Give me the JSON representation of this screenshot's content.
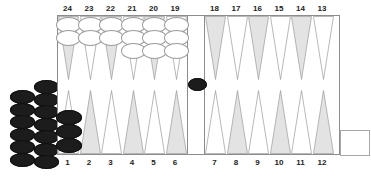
{
  "board": {
    "title": "Backgammon board position",
    "bar_label": "bar",
    "point_numbers_top": [
      "24",
      "23",
      "22",
      "21",
      "20",
      "19",
      "18",
      "17",
      "16",
      "15",
      "14",
      "13"
    ],
    "point_numbers_bottom": [
      "1",
      "2",
      "3",
      "4",
      "5",
      "6",
      "7",
      "8",
      "9",
      "10",
      "11",
      "12"
    ],
    "colors": {
      "point_light": "#ffffff",
      "point_shaded": "#e3e3e3",
      "point_outline": "#9a9a9a",
      "frame": "#8c8c8c",
      "black_checker": "#1c1c1c",
      "white_checker": "#ffffff",
      "white_checker_outline": "#9a9a9a",
      "label_text": "#222222",
      "background": "#ffffff"
    },
    "points": [
      {
        "number": "24",
        "quadrant": "top-left",
        "index": 0,
        "checkers": 2,
        "color": "white"
      },
      {
        "number": "23",
        "quadrant": "top-left",
        "index": 1,
        "checkers": 2,
        "color": "white"
      },
      {
        "number": "22",
        "quadrant": "top-left",
        "index": 2,
        "checkers": 2,
        "color": "white"
      },
      {
        "number": "21",
        "quadrant": "top-left",
        "index": 3,
        "checkers": 3,
        "color": "white"
      },
      {
        "number": "20",
        "quadrant": "top-left",
        "index": 4,
        "checkers": 3,
        "color": "white"
      },
      {
        "number": "19",
        "quadrant": "top-left",
        "index": 5,
        "checkers": 3,
        "color": "white"
      },
      {
        "number": "18",
        "quadrant": "top-right",
        "index": 0,
        "checkers": 0,
        "color": ""
      },
      {
        "number": "17",
        "quadrant": "top-right",
        "index": 1,
        "checkers": 0,
        "color": ""
      },
      {
        "number": "16",
        "quadrant": "top-right",
        "index": 2,
        "checkers": 0,
        "color": ""
      },
      {
        "number": "15",
        "quadrant": "top-right",
        "index": 3,
        "checkers": 0,
        "color": ""
      },
      {
        "number": "14",
        "quadrant": "top-right",
        "index": 4,
        "checkers": 0,
        "color": ""
      },
      {
        "number": "13",
        "quadrant": "top-right",
        "index": 5,
        "checkers": 0,
        "color": ""
      },
      {
        "number": "1",
        "quadrant": "bottom-left",
        "index": 0,
        "checkers": 3,
        "color": "black"
      },
      {
        "number": "2",
        "quadrant": "bottom-left",
        "index": 1,
        "checkers": 0,
        "color": ""
      },
      {
        "number": "3",
        "quadrant": "bottom-left",
        "index": 2,
        "checkers": 0,
        "color": ""
      },
      {
        "number": "4",
        "quadrant": "bottom-left",
        "index": 3,
        "checkers": 0,
        "color": ""
      },
      {
        "number": "5",
        "quadrant": "bottom-left",
        "index": 4,
        "checkers": 0,
        "color": ""
      },
      {
        "number": "6",
        "quadrant": "bottom-left",
        "index": 5,
        "checkers": 0,
        "color": ""
      },
      {
        "number": "7",
        "quadrant": "bottom-right",
        "index": 0,
        "checkers": 0,
        "color": ""
      },
      {
        "number": "8",
        "quadrant": "bottom-right",
        "index": 1,
        "checkers": 0,
        "color": ""
      },
      {
        "number": "9",
        "quadrant": "bottom-right",
        "index": 2,
        "checkers": 0,
        "color": ""
      },
      {
        "number": "10",
        "quadrant": "bottom-right",
        "index": 3,
        "checkers": 0,
        "color": ""
      },
      {
        "number": "11",
        "quadrant": "bottom-right",
        "index": 4,
        "checkers": 0,
        "color": ""
      },
      {
        "number": "12",
        "quadrant": "bottom-right",
        "index": 5,
        "checkers": 0,
        "color": ""
      }
    ],
    "bar_checkers": {
      "count": 1,
      "color": "black"
    },
    "off_board_left": {
      "label": "black off-board checkers",
      "color": "black",
      "column_left_count": 6,
      "column_right_count": 7,
      "total": 13
    },
    "bear_off_tray": {
      "label": "bear-off tray",
      "count": 0
    }
  }
}
